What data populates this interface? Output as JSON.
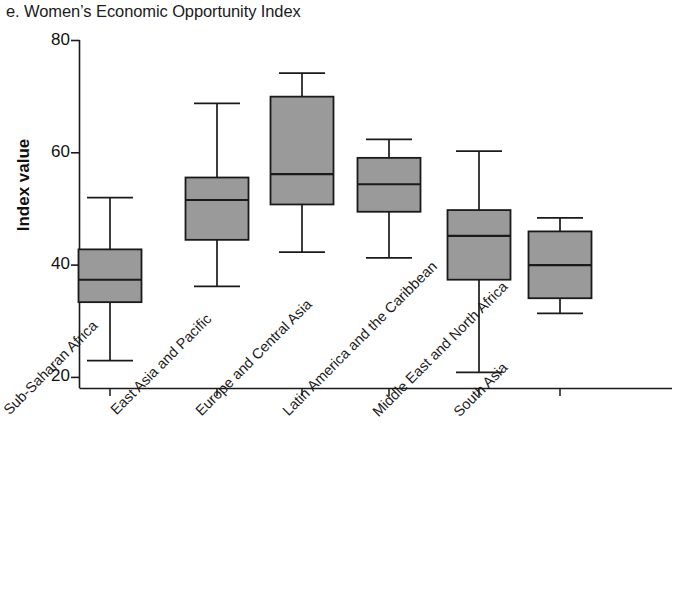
{
  "figure": {
    "panel_letter": "e.",
    "title": "e. Women’s Economic Opportunity Index",
    "ylabel": "Index value"
  },
  "axis": {
    "y_ticks": [
      "80",
      "60",
      "40",
      "20"
    ],
    "y_tick_values": [
      80,
      60,
      40,
      20
    ]
  },
  "categories": [
    "Sub-Saharan Africa",
    "East Asia and Pacific",
    "Europe and Central Asia",
    "Latin America and the Caribbean",
    "Middle East and North Africa",
    "South Asia"
  ],
  "colors": {
    "box_fill": "#9a9a9a",
    "box_stroke": "#1a1a1a",
    "axis": "#1a1a1a",
    "background": "#ffffff",
    "text": "#1b1b1b"
  },
  "chart_data": {
    "type": "box",
    "title": "e. Women’s Economic Opportunity Index",
    "xlabel": "",
    "ylabel": "Index value",
    "ylim": [
      18,
      80
    ],
    "yticks": [
      20,
      40,
      60,
      80
    ],
    "grid": false,
    "legend": null,
    "categories": [
      "Sub-Saharan Africa",
      "East Asia and Pacific",
      "Europe and Central Asia",
      "Latin America and the Caribbean",
      "Middle East and North Africa",
      "South Asia"
    ],
    "boxes": [
      {
        "category": "Sub-Saharan Africa",
        "whisker_high": 52.0,
        "q3": 42.8,
        "median": 37.4,
        "q1": 33.4,
        "whisker_low": 23.0
      },
      {
        "category": "East Asia and Pacific",
        "whisker_high": 68.8,
        "q3": 55.6,
        "median": 51.6,
        "q1": 44.5,
        "whisker_low": 36.2
      },
      {
        "category": "Europe and Central Asia",
        "whisker_high": 74.2,
        "q3": 70.0,
        "median": 56.2,
        "q1": 50.8,
        "whisker_low": 42.3
      },
      {
        "category": "Latin America and the Caribbean",
        "whisker_high": 62.4,
        "q3": 59.1,
        "median": 54.4,
        "q1": 49.5,
        "whisker_low": 41.3
      },
      {
        "category": "Middle East and North Africa",
        "whisker_high": 60.3,
        "q3": 49.8,
        "median": 45.2,
        "q1": 37.4,
        "whisker_low": 20.9
      },
      {
        "category": "South Asia",
        "whisker_high": 48.4,
        "q3": 46.0,
        "median": 40.0,
        "q1": 34.1,
        "whisker_low": 31.4
      }
    ]
  }
}
